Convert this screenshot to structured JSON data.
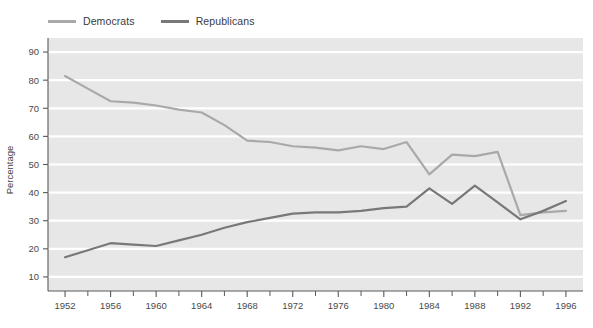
{
  "legend": {
    "position": "top-left",
    "items": [
      {
        "label": "Democrats",
        "color": "#a9a9a9"
      },
      {
        "label": "Republicans",
        "color": "#787878"
      }
    ]
  },
  "axes": {
    "ylabel": "Percentage",
    "xlabel": "",
    "ylim": [
      5,
      95
    ],
    "yticks": [
      10,
      20,
      30,
      40,
      50,
      60,
      70,
      80,
      90
    ],
    "xticks": [
      1952,
      1956,
      1960,
      1964,
      1968,
      1972,
      1976,
      1980,
      1984,
      1988,
      1992,
      1996
    ],
    "xminorticks": [
      1954,
      1958,
      1962,
      1966,
      1970,
      1974,
      1978,
      1982,
      1986,
      1990,
      1994
    ],
    "xlim": [
      1950.5,
      1997.5
    ],
    "grid": "horizontal-white-on-gray"
  },
  "style": {
    "plot_background": "#e7e7e7",
    "gridline_color": "#ffffff",
    "page_background": "#ffffff",
    "axis_color": "#5a5a5a",
    "tick_label_color": "#4a4a4a"
  },
  "chart_data": {
    "type": "line",
    "title": "",
    "xlabel": "",
    "ylabel": "Percentage",
    "xlim": [
      1950.5,
      1997.5
    ],
    "ylim": [
      5,
      95
    ],
    "grid": true,
    "legend_position": "top-left",
    "x": [
      1952,
      1954,
      1956,
      1958,
      1960,
      1962,
      1964,
      1966,
      1968,
      1970,
      1972,
      1974,
      1976,
      1978,
      1980,
      1982,
      1984,
      1986,
      1988,
      1990,
      1992,
      1994,
      1996
    ],
    "series": [
      {
        "name": "Democrats",
        "color": "#a9a9a9",
        "values": [
          81.5,
          77.0,
          72.5,
          72.0,
          71.0,
          69.5,
          68.5,
          64.0,
          58.5,
          58.0,
          56.5,
          56.0,
          55.0,
          56.5,
          55.5,
          58.0,
          46.5,
          53.5,
          53.0,
          54.5,
          32.0,
          33.0,
          33.5
        ]
      },
      {
        "name": "Republicans",
        "color": "#787878",
        "values": [
          17.0,
          19.5,
          22.0,
          21.5,
          21.0,
          23.0,
          25.0,
          27.5,
          29.5,
          31.0,
          32.5,
          33.0,
          33.0,
          33.5,
          34.5,
          35.0,
          41.5,
          36.0,
          42.5,
          36.5,
          30.5,
          33.5,
          37.0
        ]
      }
    ]
  }
}
